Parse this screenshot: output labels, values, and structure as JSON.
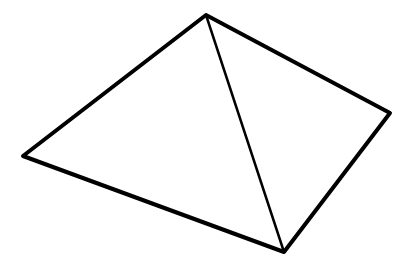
{
  "diagram": {
    "type": "line-drawing",
    "background": "#ffffff",
    "stroke_color": "#000000",
    "vertices": {
      "apex": [
        206,
        15
      ],
      "right": [
        390,
        113
      ],
      "bottom": [
        284,
        252
      ],
      "left": [
        23,
        156
      ]
    },
    "outline_width": 4,
    "inner_edge_width": 2.5
  }
}
